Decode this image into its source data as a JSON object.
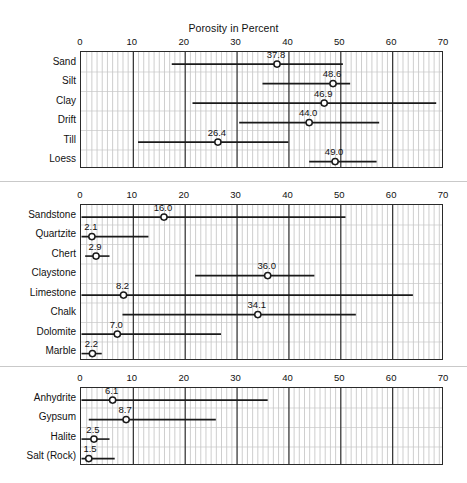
{
  "chart_title": "Porosity in Percent",
  "axis": {
    "min": 0,
    "max": 70,
    "ticks": [
      0,
      10,
      20,
      30,
      40,
      50,
      60,
      70
    ],
    "tick_labels": [
      "0",
      "10",
      "20",
      "30",
      "40",
      "50",
      "60",
      "70"
    ],
    "minor_tick_step": 1
  },
  "colors": {
    "line": "#1a1a1a",
    "frame": "#2a2a2a",
    "major_grid": "#3a3a3a",
    "minor_grid": "#b9b9b9",
    "row_grid": "#c7c7c7",
    "marker_fill": "#ffffff",
    "background": "#ffffff",
    "text": "#111111"
  },
  "chart_data": {
    "type": "scatter",
    "title": "Porosity in Percent",
    "xlabel": "Porosity in Percent",
    "ylabel": "",
    "xlim": [
      0,
      70
    ],
    "grid": true,
    "legend": "none",
    "panels": [
      {
        "name": "unconsolidated-sediments",
        "categories": [
          "Sand",
          "Silt",
          "Clay",
          "Drift",
          "Till",
          "Loess"
        ],
        "series": [
          {
            "label": "Sand",
            "mean": 37.8,
            "mean_text": "37.8",
            "low": 17.5,
            "high": 50.5
          },
          {
            "label": "Silt",
            "mean": 48.6,
            "mean_text": "48.6",
            "low": 35.0,
            "high": 51.9
          },
          {
            "label": "Clay",
            "mean": 46.9,
            "mean_text": "46.9",
            "low": 21.5,
            "high": 68.5
          },
          {
            "label": "Drift",
            "mean": 44.0,
            "mean_text": "44.0",
            "low": 30.5,
            "high": 57.5
          },
          {
            "label": "Till",
            "mean": 26.4,
            "mean_text": "26.4",
            "low": 11.0,
            "high": 40.0
          },
          {
            "label": "Loess",
            "mean": 49.0,
            "mean_text": "49.0",
            "low": 44.0,
            "high": 57.0
          }
        ]
      },
      {
        "name": "sedimentary-rocks",
        "categories": [
          "Sandstone",
          "Quartzite",
          "Chert",
          "Claystone",
          "Limestone",
          "Chalk",
          "Dolomite",
          "Marble"
        ],
        "series": [
          {
            "label": "Sandstone",
            "mean": 16.0,
            "mean_text": "16.0",
            "low": 0.0,
            "high": 51.0
          },
          {
            "label": "Quartzite",
            "mean": 2.1,
            "mean_text": "2.1",
            "low": 0.0,
            "high": 13.0
          },
          {
            "label": "Chert",
            "mean": 2.9,
            "mean_text": "2.9",
            "low": 0.8,
            "high": 5.5
          },
          {
            "label": "Claystone",
            "mean": 36.0,
            "mean_text": "36.0",
            "low": 22.0,
            "high": 45.0
          },
          {
            "label": "Limestone",
            "mean": 8.2,
            "mean_text": "8.2",
            "low": 0.0,
            "high": 64.0
          },
          {
            "label": "Chalk",
            "mean": 34.1,
            "mean_text": "34.1",
            "low": 8.0,
            "high": 53.0
          },
          {
            "label": "Dolomite",
            "mean": 7.0,
            "mean_text": "7.0",
            "low": 0.0,
            "high": 27.0
          },
          {
            "label": "Marble",
            "mean": 2.2,
            "mean_text": "2.2",
            "low": 0.0,
            "high": 4.0
          }
        ]
      },
      {
        "name": "evaporites",
        "categories": [
          "Anhydrite",
          "Gypsum",
          "Halite",
          "Salt (Rock)"
        ],
        "series": [
          {
            "label": "Anhydrite",
            "mean": 6.1,
            "mean_text": "6.1",
            "low": 0.0,
            "high": 36.0
          },
          {
            "label": "Gypsum",
            "mean": 8.7,
            "mean_text": "8.7",
            "low": 1.5,
            "high": 26.0
          },
          {
            "label": "Halite",
            "mean": 2.5,
            "mean_text": "2.5",
            "low": 0.0,
            "high": 5.5
          },
          {
            "label": "Salt (Rock)",
            "mean": 1.5,
            "mean_text": "1.5",
            "low": 0.0,
            "high": 6.5
          }
        ]
      }
    ]
  },
  "layout": {
    "plot_left": 80,
    "plot_right": 443,
    "panels": [
      {
        "top": 51,
        "row_h": 19.5,
        "axis_label_y": 36
      },
      {
        "top": 204,
        "row_h": 19.5,
        "axis_label_y": 189
      },
      {
        "top": 387,
        "row_h": 19.5,
        "axis_label_y": 372
      }
    ],
    "separators": [
      181,
      366
    ]
  }
}
